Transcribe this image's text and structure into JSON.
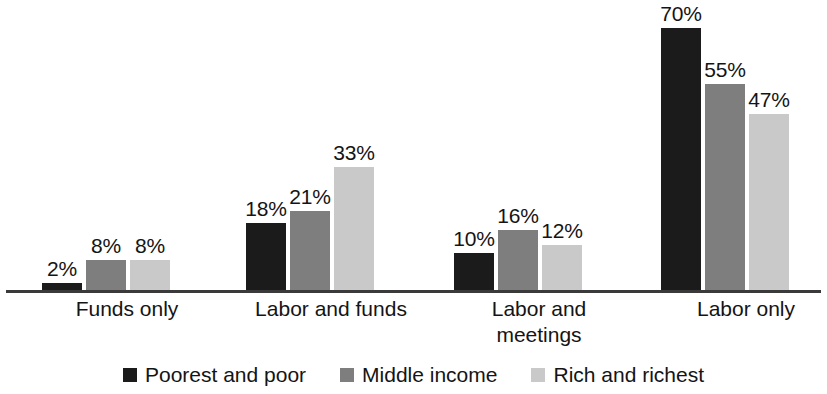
{
  "chart_data": {
    "type": "bar",
    "title": "",
    "subtitle": "",
    "xlabel": "",
    "ylabel": "",
    "ylim": [
      0,
      75
    ],
    "grid": false,
    "legend_position": "bottom",
    "value_suffix": "%",
    "categories": [
      "Funds only",
      "Labor and funds",
      "Labor and meetings",
      "Labor only"
    ],
    "category_lines": [
      [
        "Funds only"
      ],
      [
        "Labor and funds"
      ],
      [
        "Labor and",
        "meetings"
      ],
      [
        "Labor only"
      ]
    ],
    "series": [
      {
        "name": "Poorest and poor",
        "color": "#1b1b1b",
        "values": [
          2,
          18,
          10,
          70
        ],
        "labels": [
          "2%",
          "18%",
          "10%",
          "70%"
        ]
      },
      {
        "name": "Middle income",
        "color": "#7e7e7e",
        "values": [
          8,
          21,
          16,
          55
        ],
        "labels": [
          "8%",
          "21%",
          "16%",
          "55%"
        ]
      },
      {
        "name": "Rich and richest",
        "color": "#c9c9c9",
        "values": [
          8,
          33,
          12,
          47
        ],
        "labels": [
          "8%",
          "33%",
          "12%",
          "47%"
        ]
      }
    ]
  },
  "axis": {
    "baseline_color": "#3a3a3a"
  }
}
